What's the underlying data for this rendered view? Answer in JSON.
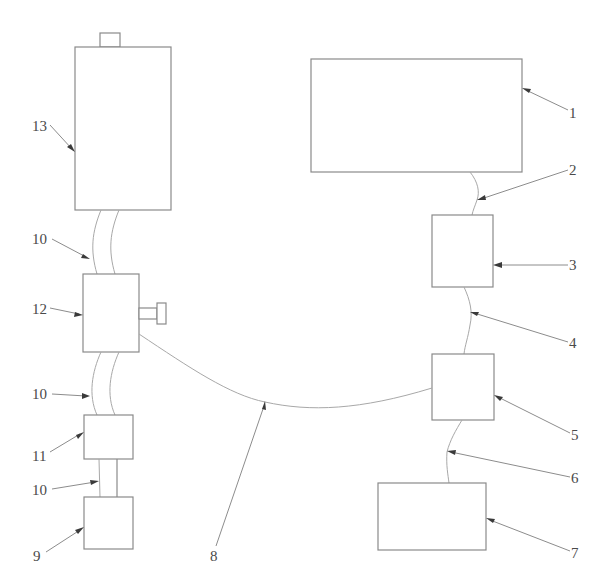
{
  "diagram": {
    "type": "schematic",
    "style": "patent line drawing",
    "colors": {
      "background": "#ffffff",
      "outline": "#8a8a8a",
      "hose": "#a8a8a8",
      "label": "#4a4a4a",
      "arrowhead": "#3a3a3a"
    },
    "labels": {
      "l1": "1",
      "l2": "2",
      "l3": "3",
      "l4": "4",
      "l5": "5",
      "l6": "6",
      "l7": "7",
      "l8": "8",
      "l9": "9",
      "l10a": "10",
      "l10b": "10",
      "l10c": "10",
      "l11": "11",
      "l12": "12",
      "l13": "13"
    },
    "components": [
      {
        "ref": "1",
        "shape": "large-rectangle"
      },
      {
        "ref": "2",
        "shape": "curved-line"
      },
      {
        "ref": "3",
        "shape": "square-box"
      },
      {
        "ref": "4",
        "shape": "curved-line"
      },
      {
        "ref": "5",
        "shape": "square-box"
      },
      {
        "ref": "6",
        "shape": "curved-line"
      },
      {
        "ref": "7",
        "shape": "rectangle"
      },
      {
        "ref": "8",
        "shape": "long-curved-line"
      },
      {
        "ref": "9",
        "shape": "square-box"
      },
      {
        "ref": "10",
        "shape": "double-line-hose",
        "count": 3
      },
      {
        "ref": "11",
        "shape": "square-box"
      },
      {
        "ref": "12",
        "shape": "rectangle-with-side-bolt"
      },
      {
        "ref": "13",
        "shape": "tall-rectangle-with-top-cap"
      }
    ]
  }
}
